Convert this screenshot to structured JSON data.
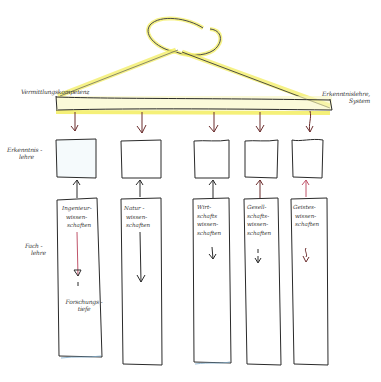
{
  "colors": {
    "ink": "#2a2a2a",
    "highlight": "#f4ef6a",
    "arrow_down": "#6b2c2c",
    "arrow_up_accent": "#c0546a",
    "box_tint": "#e6f1f6"
  },
  "labels": {
    "left_bar": "Vermittlungskompetenz",
    "right_bar_line1": "Erkenntnislehre,",
    "right_bar_line2": "System",
    "row_boxes_line1": "Erkenntnis -",
    "row_boxes_line2": "lehre",
    "row_columns_line1": "Fach -",
    "row_columns_line2": "lehre",
    "depth_line1": "Forschungs -",
    "depth_line2": "tiefe"
  },
  "columns": [
    {
      "lines": [
        "Ingenieur-",
        "wissen-",
        "schaften"
      ]
    },
    {
      "lines": [
        "Natur -",
        "wissen-",
        "schaften"
      ]
    },
    {
      "lines": [
        "Wirt-",
        "schafts",
        "wissen-",
        "schaften"
      ]
    },
    {
      "lines": [
        "Gesell-",
        "schafts-",
        "wissen-",
        "schaften"
      ]
    },
    {
      "lines": [
        "Geistes-",
        "wissen-",
        "schaften"
      ]
    }
  ]
}
